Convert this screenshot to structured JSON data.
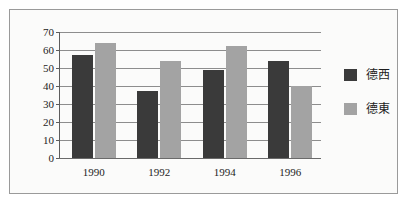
{
  "chart_data": {
    "type": "bar",
    "title": "",
    "subtitle": "",
    "xlabel": "",
    "ylabel": "",
    "categories": [
      "1990",
      "1992",
      "1994",
      "1996"
    ],
    "series": [
      {
        "name": "德西",
        "color": "#3a3a3a",
        "values": [
          57,
          37,
          49,
          54
        ]
      },
      {
        "name": "德東",
        "color": "#a3a3a3",
        "values": [
          64,
          54,
          62,
          40
        ]
      }
    ],
    "ylim": [
      0,
      70
    ],
    "ytick_step": 10,
    "yticks": [
      "0",
      "10",
      "20",
      "30",
      "40",
      "50",
      "60",
      "70"
    ],
    "grid": true,
    "grid_axis": "y",
    "legend_position": "right",
    "annotations": []
  },
  "frame": {
    "border_color": "#9a9a9a",
    "background_color": "#fbfbfa"
  }
}
